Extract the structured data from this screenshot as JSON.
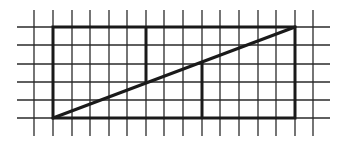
{
  "diagram": {
    "type": "grid-geometry-figure",
    "grid": {
      "columns_x": [
        34,
        53,
        72,
        90,
        109,
        127,
        146,
        164,
        183,
        202,
        220,
        239,
        258,
        276,
        295,
        313
      ],
      "rows_y": [
        27,
        45,
        64,
        82,
        100,
        118
      ],
      "x_extent": [
        17,
        330
      ],
      "y_extent": [
        10,
        136
      ],
      "line_color": "#2a2a2a",
      "line_width": 1.3
    },
    "rectangle": {
      "x1": 53,
      "y1": 27,
      "x2": 295,
      "y2": 118,
      "cells_wide": 13,
      "cells_tall": 5
    },
    "diagonal": {
      "x1": 53,
      "y1": 118,
      "x2": 295,
      "y2": 27
    },
    "inner_segments": [
      {
        "name": "upper-vertical",
        "x": 146,
        "y1": 27,
        "y2": 83
      },
      {
        "name": "lower-vertical",
        "x": 202,
        "y1": 62,
        "y2": 118
      }
    ],
    "bold_color": "#1a1a1a",
    "bold_width": 3
  }
}
